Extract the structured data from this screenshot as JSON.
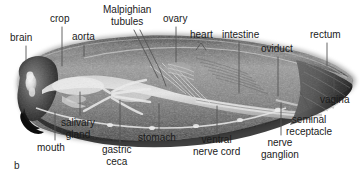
{
  "figure": {
    "panel_letter": "b",
    "background_color": "#ffffff",
    "text_color": "#1b1b1b",
    "leader_color": "#555555"
  },
  "labels": [
    {
      "id": "brain",
      "text": "brain",
      "text2": "",
      "x": 10,
      "y": 32,
      "align": "left"
    },
    {
      "id": "crop",
      "text": "crop",
      "text2": "",
      "x": 50,
      "y": 13,
      "align": "left"
    },
    {
      "id": "aorta",
      "text": "aorta",
      "text2": "",
      "x": 72,
      "y": 31,
      "align": "left"
    },
    {
      "id": "malpighian-tubules",
      "text": "Malpighian",
      "text2": "tubules",
      "x": 103,
      "y": 4,
      "align": "center"
    },
    {
      "id": "ovary",
      "text": "ovary",
      "text2": "",
      "x": 163,
      "y": 13,
      "align": "left"
    },
    {
      "id": "heart",
      "text": "heart",
      "text2": "",
      "x": 190,
      "y": 29,
      "align": "left"
    },
    {
      "id": "intestine",
      "text": "intestine",
      "text2": "",
      "x": 222,
      "y": 29,
      "align": "left"
    },
    {
      "id": "oviduct",
      "text": "oviduct",
      "text2": "",
      "x": 261,
      "y": 43,
      "align": "left"
    },
    {
      "id": "rectum",
      "text": "rectum",
      "text2": "",
      "x": 310,
      "y": 29,
      "align": "left"
    },
    {
      "id": "vagina",
      "text": "vagina",
      "text2": "",
      "x": 320,
      "y": 94,
      "align": "left"
    },
    {
      "id": "seminal-receptacle",
      "text": "seminal",
      "text2": "receptacle",
      "x": 286,
      "y": 114,
      "align": "center"
    },
    {
      "id": "nerve-ganglion",
      "text": "nerve",
      "text2": "ganglion",
      "x": 261,
      "y": 137,
      "align": "center"
    },
    {
      "id": "ventral-nerve-cord",
      "text": "ventral",
      "text2": "nerve cord",
      "x": 193,
      "y": 134,
      "align": "center"
    },
    {
      "id": "stomach",
      "text": "stomach",
      "text2": "",
      "x": 138,
      "y": 132,
      "align": "left"
    },
    {
      "id": "gastric-ceca",
      "text": "gastric",
      "text2": "ceca",
      "x": 102,
      "y": 144,
      "align": "center"
    },
    {
      "id": "mouth",
      "text": "mouth",
      "text2": "",
      "x": 37,
      "y": 142,
      "align": "left"
    },
    {
      "id": "salivary-gland",
      "text": "salivary",
      "text2": "gland",
      "x": 61,
      "y": 117,
      "align": "center"
    }
  ],
  "leaders": [
    {
      "id": "brain-leader",
      "points": "26,46 26,62"
    },
    {
      "id": "crop-leader",
      "points": "62,27 62,66"
    },
    {
      "id": "aorta-leader",
      "points": "84,45 84,56"
    },
    {
      "id": "malpighian-tubules-leader",
      "points": "134,30 150,62 158,78"
    },
    {
      "id": "malpighian-tubules-leader2",
      "points": "140,30 160,70 166,86"
    },
    {
      "id": "ovary-leader",
      "points": "176,27 176,62"
    },
    {
      "id": "heart-arrow",
      "points": "196,50 201,43 206,50"
    },
    {
      "id": "intestine-leader",
      "points": "239,43 239,93"
    },
    {
      "id": "oviduct-leader",
      "points": "278,57 278,96"
    },
    {
      "id": "rectum-leader",
      "points": "327,43 327,66"
    },
    {
      "id": "vagina-leader",
      "points": "334,76 334,92"
    },
    {
      "id": "seminal-receptacle-leader",
      "points": "311,112 305,100 300,92"
    },
    {
      "id": "nerve-ganglion-leader",
      "points": "281,135 281,103"
    },
    {
      "id": "ventral-nerve-cord-leader",
      "points": "217,132 217,106"
    },
    {
      "id": "stomach-leader",
      "points": "159,130 159,104"
    },
    {
      "id": "gastric-ceca-leader",
      "points": "120,142 120,100"
    },
    {
      "id": "mouth-leader",
      "points": "55,140 55,112"
    },
    {
      "id": "salivary-gland-leader",
      "points": "80,115 80,92"
    }
  ]
}
